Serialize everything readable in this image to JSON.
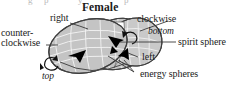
{
  "figure": {
    "title": "Female",
    "cropped_line_above": "g p y p",
    "background_color": "#ffffff",
    "ink_color": "#1a1a1a",
    "sphere_fill": "#c8c8c8",
    "sphere_mesh_color": "#ffffff",
    "sphere_outline_color": "#4a4a4a",
    "arrow_color": "#000000"
  },
  "labels": {
    "right": "right",
    "counter_line1": "counter-",
    "counter_line2": "clockwise",
    "clockwise": "clockwise",
    "bottom": "bottom",
    "spirit_sphere": "spirit sphere",
    "left": "left",
    "energy_spheres": "energy spheres",
    "top": "top"
  },
  "icons": {
    "rotation_ccw": "counter-clockwise-rotation-arrow-icon",
    "rotation_cw": "clockwise-rotation-arrow-icon",
    "pointer_right": "arrowhead-right-icon",
    "pointer_left": "arrowhead-left-icon"
  },
  "diagram_elements": [
    {
      "name": "spirit-sphere",
      "kind": "mesh-ellipsoid",
      "note": "rear large ellipsoid"
    },
    {
      "name": "energy-sphere-front",
      "kind": "mesh-ellipsoid",
      "note": "front tilted ellipsoid"
    },
    {
      "name": "energy-sphere-right",
      "kind": "mesh-ellipsoid",
      "note": "right overlapping ellipsoid"
    }
  ]
}
